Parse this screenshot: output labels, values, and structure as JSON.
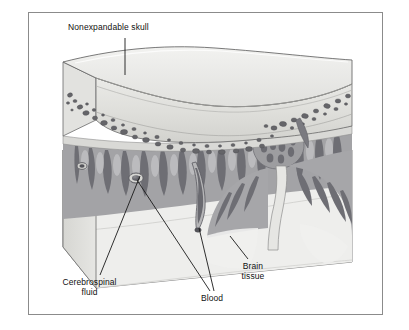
{
  "figure": {
    "type": "anatomical-illustration",
    "border_color": "#8b8b8b",
    "background_color": "#ffffff"
  },
  "labels": {
    "skull": {
      "text": "Nonexpandable skull",
      "leader": "vertical line from text down to the top surface of the skull slab"
    },
    "csf": {
      "text": "Cerebrospinal\nfluid",
      "leader": "diagonal line up and to the right into the subarachnoid space"
    },
    "blood": {
      "text": "Blood",
      "leader": "two lines rising to two cut blood vessels"
    },
    "brain": {
      "text": "Brain\ntissue",
      "leader": "short diagonal line up and to the left into the pale brain parenchyma"
    }
  },
  "palette": {
    "skull_top": "#e8e8e6",
    "skull_top_shade": "#dcdcda",
    "skull_cut_face": "#d8d8d4",
    "diploe_cell": "#6e6e72",
    "diploe_cell_dark": "#4a4a50",
    "dura_gray": "#9a9a9c",
    "cortex_gray": "#a8a8aa",
    "sulcus_dark": "#6f6f74",
    "csf_pale": "#e4e4e2",
    "brain_pale": "#efefed",
    "vessel_dark": "#5c5c62",
    "outline": "#5a5a5a",
    "text": "#111111"
  }
}
